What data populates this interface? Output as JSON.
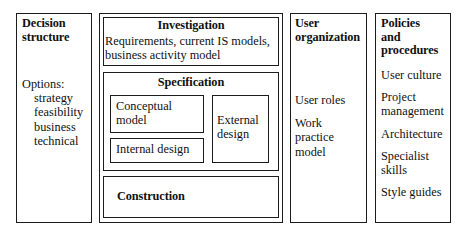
{
  "diagram": {
    "columns": {
      "decision": {
        "title_line1": "Decision",
        "title_line2": "structure",
        "options_heading": "Options:",
        "options": [
          "strategy",
          "feasibility",
          "business",
          "technical"
        ]
      },
      "investigation": {
        "title": "Investigation",
        "desc_line1": "Requirements, current IS models,",
        "desc_line2": "business activity model",
        "specification": {
          "title": "Specification",
          "conceptual_line1": "Conceptual",
          "conceptual_line2": "model",
          "internal_design": "Internal design",
          "external_line1": "External",
          "external_line2": "design"
        },
        "construction": {
          "title": "Construction"
        }
      },
      "user_organization": {
        "title_line1": "User",
        "title_line2": "organization",
        "items": [
          {
            "line1": "User roles",
            "line2": "",
            "line3": ""
          },
          {
            "line1": "Work",
            "line2": "practice",
            "line3": "model"
          }
        ]
      },
      "policies": {
        "title_line1": "Policies",
        "title_line2": "and",
        "title_line3": "procedures",
        "items": [
          {
            "line1": "User culture",
            "line2": ""
          },
          {
            "line1": "Project",
            "line2": "management"
          },
          {
            "line1": "Architecture",
            "line2": ""
          },
          {
            "line1": "Specialist",
            "line2": "skills"
          },
          {
            "line1": "Style guides",
            "line2": ""
          }
        ]
      }
    },
    "colors": {
      "border": "#1c1c1c",
      "background": "#ffffff",
      "text": "#111111"
    }
  }
}
